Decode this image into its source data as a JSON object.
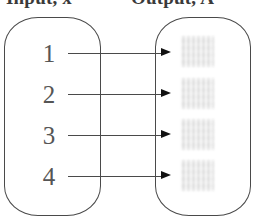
{
  "diagram": {
    "type": "function-mapping-diagram",
    "background_color": "#ffffff",
    "line_color": "#4a4a4a",
    "text_color": "#555555",
    "redaction_color": "#e8e8e8",
    "headers": {
      "input_label": "Input, x",
      "output_label": "Output, A"
    },
    "input_set": {
      "name": "input-set",
      "elements": [
        {
          "label": "1"
        },
        {
          "label": "2"
        },
        {
          "label": "3"
        },
        {
          "label": "4"
        }
      ]
    },
    "output_set": {
      "name": "output-set",
      "elements": [
        {
          "label": ""
        },
        {
          "label": ""
        },
        {
          "label": ""
        },
        {
          "label": ""
        }
      ]
    },
    "mappings": [
      {
        "from": "1",
        "to": ""
      },
      {
        "from": "2",
        "to": ""
      },
      {
        "from": "3",
        "to": ""
      },
      {
        "from": "4",
        "to": ""
      }
    ]
  }
}
